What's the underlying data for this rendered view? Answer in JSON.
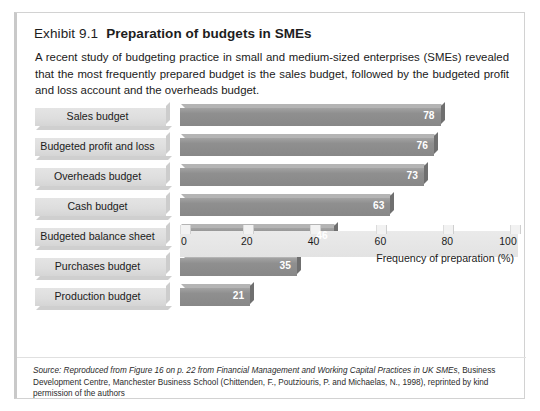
{
  "exhibit": {
    "label": "Exhibit 9.1",
    "title": "Preparation of budgets in SMEs",
    "intro": "A recent study of budgeting practice in small and medium-sized enterprises (SMEs) revealed that the most frequently prepared budget is the sales budget, followed by the budgeted profit and loss account and the overheads budget."
  },
  "source": {
    "prefix": "Source: Reproduced from Figure 16 on p. 22 from ",
    "work_title": "Financial Management and Working Capital Practices in UK SMEs",
    "suffix": ", Business Development Centre, Manchester Business School (Chittenden, F., Poutziouris, P. and Michaelas, N., 1998), reprinted by kind permission of the authors"
  },
  "colors": {
    "bar_face": "#8f8f8f",
    "bar_top": "#b4b4b4",
    "bar_side": "#6f6f6f",
    "label_plate": "#dedede",
    "axis_plate": "#e6e6e6",
    "card_border": "#d2d2d2",
    "value_text": "#ffffff"
  },
  "chart_data": {
    "type": "bar",
    "orientation": "horizontal",
    "title": "Preparation of budgets in SMEs",
    "categories": [
      "Sales budget",
      "Budgeted profit and loss",
      "Overheads budget",
      "Cash budget",
      "Budgeted balance sheet",
      "Purchases budget",
      "Production budget"
    ],
    "values": [
      78,
      76,
      73,
      63,
      46,
      35,
      21
    ],
    "xlabel": "Frequency of preparation (%)",
    "ylabel": "",
    "xlim": [
      0,
      100
    ],
    "xticks": [
      0,
      20,
      40,
      60,
      80,
      100
    ],
    "xtick_labels": [
      "0",
      "20",
      "40",
      "60",
      "80",
      "100"
    ],
    "grid": false,
    "legend": false,
    "data_labels": true
  }
}
